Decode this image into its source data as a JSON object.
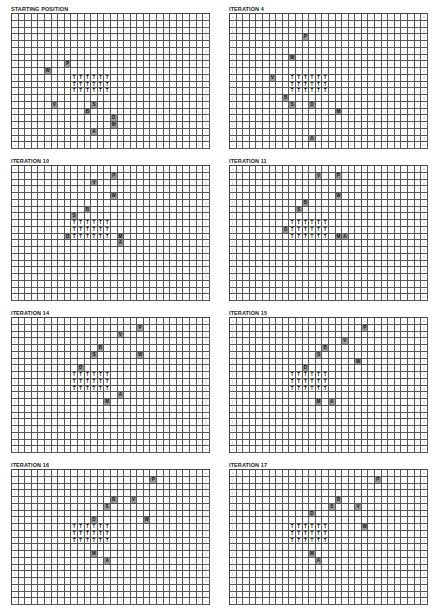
{
  "grid": {
    "cols": 30,
    "rows": 20,
    "border_corner": "+",
    "border_h": "-",
    "border_v": "|"
  },
  "colors": {
    "agent_bg": "#9c9c9c",
    "grid_line": "#555555",
    "background": "#ffffff"
  },
  "legend_symbols": [
    "P",
    "W",
    "V",
    "S",
    "B",
    "D",
    "M",
    "A",
    "T"
  ],
  "panels": [
    {
      "title": "STARTING POSITION",
      "trees": {
        "rows": [
          9,
          10,
          11
        ],
        "cols": [
          9,
          10,
          11,
          12,
          13,
          14
        ]
      },
      "agents": [
        {
          "label": "P",
          "row": 7,
          "col": 8
        },
        {
          "label": "W",
          "row": 8,
          "col": 5
        },
        {
          "label": "V",
          "row": 13,
          "col": 6
        },
        {
          "label": "S",
          "row": 13,
          "col": 12
        },
        {
          "label": "B",
          "row": 14,
          "col": 11
        },
        {
          "label": "D",
          "row": 15,
          "col": 15
        },
        {
          "label": "M",
          "row": 16,
          "col": 15
        },
        {
          "label": "A",
          "row": 17,
          "col": 12
        }
      ]
    },
    {
      "title": "ITERATION 4",
      "trees": {
        "rows": [
          9,
          10,
          11
        ],
        "cols": [
          9,
          10,
          11,
          12,
          13,
          14
        ]
      },
      "agents": [
        {
          "label": "P",
          "row": 3,
          "col": 11
        },
        {
          "label": "W",
          "row": 6,
          "col": 9
        },
        {
          "label": "V",
          "row": 9,
          "col": 6
        },
        {
          "label": "B",
          "row": 12,
          "col": 8
        },
        {
          "label": "S",
          "row": 13,
          "col": 9
        },
        {
          "label": "D",
          "row": 13,
          "col": 12
        },
        {
          "label": "M",
          "row": 14,
          "col": 16
        },
        {
          "label": "A",
          "row": 18,
          "col": 12
        }
      ]
    },
    {
      "title": "ITERATION 10",
      "trees": {
        "rows": [
          8,
          9,
          10
        ],
        "cols": [
          9,
          10,
          11,
          12,
          13,
          14
        ]
      },
      "agents": [
        {
          "label": "P",
          "row": 1,
          "col": 15
        },
        {
          "label": "V",
          "row": 2,
          "col": 12
        },
        {
          "label": "W",
          "row": 4,
          "col": 15
        },
        {
          "label": "B",
          "row": 6,
          "col": 11
        },
        {
          "label": "S",
          "row": 7,
          "col": 9
        },
        {
          "label": "D",
          "row": 10,
          "col": 8
        },
        {
          "label": "M",
          "row": 10,
          "col": 16
        },
        {
          "label": "A",
          "row": 11,
          "col": 16
        }
      ]
    },
    {
      "title": "ITERATION 11",
      "trees": {
        "rows": [
          8,
          9,
          10
        ],
        "cols": [
          9,
          10,
          11,
          12,
          13,
          14
        ]
      },
      "agents": [
        {
          "label": "V",
          "row": 1,
          "col": 13
        },
        {
          "label": "P",
          "row": 1,
          "col": 16
        },
        {
          "label": "W",
          "row": 4,
          "col": 16
        },
        {
          "label": "B",
          "row": 5,
          "col": 11
        },
        {
          "label": "S",
          "row": 6,
          "col": 10
        },
        {
          "label": "D",
          "row": 9,
          "col": 8
        },
        {
          "label": "M",
          "row": 10,
          "col": 16
        },
        {
          "label": "A",
          "row": 10,
          "col": 17
        }
      ]
    },
    {
      "title": "ITERATION 14",
      "trees": {
        "rows": [
          8,
          9,
          10
        ],
        "cols": [
          9,
          10,
          11,
          12,
          13,
          14
        ]
      },
      "agents": [
        {
          "label": "P",
          "row": 1,
          "col": 19
        },
        {
          "label": "V",
          "row": 2,
          "col": 16
        },
        {
          "label": "B",
          "row": 4,
          "col": 13
        },
        {
          "label": "S",
          "row": 5,
          "col": 12
        },
        {
          "label": "W",
          "row": 5,
          "col": 19
        },
        {
          "label": "D",
          "row": 7,
          "col": 10
        },
        {
          "label": "A",
          "row": 11,
          "col": 16
        },
        {
          "label": "M",
          "row": 12,
          "col": 14
        }
      ]
    },
    {
      "title": "ITERATION 15",
      "trees": {
        "rows": [
          8,
          9,
          10
        ],
        "cols": [
          9,
          10,
          11,
          12,
          13,
          14
        ]
      },
      "agents": [
        {
          "label": "P",
          "row": 1,
          "col": 20
        },
        {
          "label": "V",
          "row": 3,
          "col": 17
        },
        {
          "label": "B",
          "row": 4,
          "col": 14
        },
        {
          "label": "S",
          "row": 5,
          "col": 13
        },
        {
          "label": "W",
          "row": 6,
          "col": 19
        },
        {
          "label": "D",
          "row": 7,
          "col": 11
        },
        {
          "label": "M",
          "row": 12,
          "col": 13
        },
        {
          "label": "A",
          "row": 12,
          "col": 15
        }
      ]
    },
    {
      "title": "ITERATION 16",
      "trees": {
        "rows": [
          8,
          9,
          10
        ],
        "cols": [
          9,
          10,
          11,
          12,
          13,
          14
        ]
      },
      "agents": [
        {
          "label": "P",
          "row": 1,
          "col": 21
        },
        {
          "label": "B",
          "row": 4,
          "col": 15
        },
        {
          "label": "V",
          "row": 4,
          "col": 18
        },
        {
          "label": "S",
          "row": 5,
          "col": 14
        },
        {
          "label": "D",
          "row": 7,
          "col": 12
        },
        {
          "label": "W",
          "row": 7,
          "col": 20
        },
        {
          "label": "M",
          "row": 12,
          "col": 12
        },
        {
          "label": "A",
          "row": 13,
          "col": 14
        }
      ]
    },
    {
      "title": "ITERATION 17",
      "trees": {
        "rows": [
          8,
          9,
          10
        ],
        "cols": [
          9,
          10,
          11,
          12,
          13,
          14
        ]
      },
      "agents": [
        {
          "label": "P",
          "row": 1,
          "col": 22
        },
        {
          "label": "B",
          "row": 4,
          "col": 16
        },
        {
          "label": "S",
          "row": 5,
          "col": 15
        },
        {
          "label": "V",
          "row": 5,
          "col": 19
        },
        {
          "label": "D",
          "row": 6,
          "col": 12
        },
        {
          "label": "W",
          "row": 8,
          "col": 20
        },
        {
          "label": "M",
          "row": 12,
          "col": 12
        },
        {
          "label": "A",
          "row": 13,
          "col": 13
        }
      ]
    }
  ]
}
